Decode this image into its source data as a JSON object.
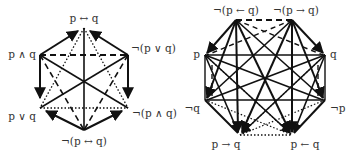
{
  "diagrams": [
    {
      "name": "hexagon",
      "nodes": [
        {
          "id": "top",
          "label": "p ↔ q"
        },
        {
          "id": "ul",
          "label": "p ∧ q"
        },
        {
          "id": "ur",
          "label": "¬(p ∨ q)"
        },
        {
          "id": "ll",
          "label": "p ∨ q"
        },
        {
          "id": "lr",
          "label": "¬(p ∧ q)"
        },
        {
          "id": "bot",
          "label": "¬(p ↔ q)"
        }
      ]
    },
    {
      "name": "octagon",
      "nodes": [
        {
          "id": "tl",
          "label": "¬(p ← q)"
        },
        {
          "id": "tr",
          "label": "¬(p → q)"
        },
        {
          "id": "ml",
          "label": "p"
        },
        {
          "id": "mr",
          "label": "q"
        },
        {
          "id": "ll",
          "label": "¬q"
        },
        {
          "id": "lr",
          "label": "¬p"
        },
        {
          "id": "bl",
          "label": "p → q"
        },
        {
          "id": "br",
          "label": "p ← q"
        }
      ]
    }
  ]
}
